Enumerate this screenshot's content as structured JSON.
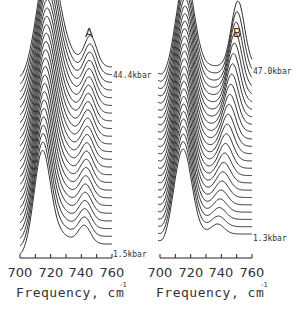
{
  "chart_data": [
    {
      "type": "line",
      "panel": "A",
      "title": "A",
      "xlabel": "Frequency, cm",
      "xlabel_superscript": "-1",
      "ylabel": "",
      "xlim": [
        700,
        760
      ],
      "xticks": [
        700,
        720,
        740,
        760
      ],
      "minor_ticks": [
        700,
        710,
        720,
        730,
        740,
        750,
        760
      ],
      "grid": false,
      "stacked_offset_series": true,
      "series_count": 24,
      "annotations": [
        {
          "text": "44.4kbar",
          "position": "top curve right end"
        },
        {
          "text": "1.5kbar",
          "position": "bottom curve right end"
        }
      ],
      "pressure_range_kbar": [
        1.5,
        44.4
      ],
      "peaks": [
        {
          "name": "main",
          "center_start": 714,
          "center_end": 718,
          "description": "dominant band near 715-718 cm-1, sharpens and shifts with pressure"
        },
        {
          "name": "shoulder",
          "center_start": 742,
          "center_end": 748,
          "description": "weak shoulder near 745 cm-1"
        }
      ]
    },
    {
      "type": "line",
      "panel": "B",
      "title": "B",
      "xlabel": "Frequency, cm",
      "xlabel_superscript": "-1",
      "ylabel": "",
      "xlim": [
        700,
        760
      ],
      "xticks": [
        700,
        720,
        740,
        760
      ],
      "minor_ticks": [
        700,
        710,
        720,
        730,
        740,
        750,
        760
      ],
      "grid": false,
      "stacked_offset_series": true,
      "series_count": 24,
      "annotations": [
        {
          "text": "47.0kbar",
          "position": "top curve right end"
        },
        {
          "text": "1.3kbar",
          "position": "bottom curve right end"
        }
      ],
      "pressure_range_kbar": [
        1.3,
        47.0
      ],
      "peaks": [
        {
          "name": "main",
          "center_start": 716,
          "center_end": 718,
          "description": "dominant band near 717 cm-1"
        },
        {
          "name": "second",
          "center_start": 738,
          "center_end": 751,
          "description": "second band grows and shifts from ~738 to ~751 cm-1 with pressure"
        }
      ]
    }
  ],
  "panels": {
    "a": {
      "label": "A",
      "top_pressure": "44.4kbar",
      "bottom_pressure": "1.5kbar"
    },
    "b": {
      "label": "B",
      "top_pressure": "47.0kbar",
      "bottom_pressure": "1.3kbar"
    }
  },
  "axis": {
    "tick_labels": [
      "700",
      "720",
      "740",
      "760"
    ],
    "xlabel": "Frequency, cm",
    "xlabel_sup": "-1"
  }
}
